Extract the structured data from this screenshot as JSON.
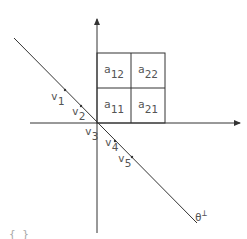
{
  "diagram": {
    "axes": {
      "x_axis": "horizontal-arrow",
      "y_axis": "vertical-arrow"
    },
    "grid_cells": [
      {
        "base": "a",
        "sub": "12"
      },
      {
        "base": "a",
        "sub": "22"
      },
      {
        "base": "a",
        "sub": "11"
      },
      {
        "base": "a",
        "sub": "21"
      }
    ],
    "points": [
      {
        "base": "v",
        "sub": "1"
      },
      {
        "base": "v",
        "sub": "2"
      },
      {
        "base": "v",
        "sub": "3"
      },
      {
        "base": "v",
        "sub": "4"
      },
      {
        "base": "v",
        "sub": "5"
      }
    ],
    "line_label": {
      "base": "θ",
      "sup": "⊥"
    },
    "bottom_fragment": "{  }",
    "colors": {
      "stroke": "#333333",
      "text": "#555555"
    }
  }
}
